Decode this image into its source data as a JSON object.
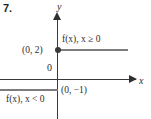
{
  "figure": {
    "problem_number": "7.",
    "axes": {
      "x_label": "x",
      "y_label": "y",
      "origin_label": "0"
    },
    "points": [
      {
        "label": "(0, 2)",
        "x": 0,
        "y": 2,
        "marker": "closed-dot"
      },
      {
        "label": "(0, −1)",
        "x": 0,
        "y": -1,
        "marker": "none"
      }
    ],
    "pieces": [
      {
        "label": "f(x), x ≥ 0",
        "value": 2,
        "domain": "x ≥ 0"
      },
      {
        "label": "f(x), x < 0",
        "value": -1,
        "domain": "x < 0"
      }
    ],
    "colors": {
      "axis": "#3a3a3a",
      "ray": "#7d7d7d",
      "text": "#2b2b2b",
      "background": "#ffffff"
    }
  },
  "chart_data": {
    "type": "line",
    "title": "",
    "subtitle": "",
    "xlabel": "x",
    "ylabel": "y",
    "xlim": [
      -7,
      10
    ],
    "ylim": [
      -4,
      8
    ],
    "grid": false,
    "legend": "none",
    "series": [
      {
        "name": "f(x), x ≥ 0",
        "values": [
          {
            "x": 0,
            "y": 2
          },
          {
            "x": 8,
            "y": 2
          }
        ],
        "style": "ray-right",
        "endpoint": "closed",
        "color": "#7d7d7d"
      },
      {
        "name": "f(x), x < 0",
        "values": [
          {
            "x": -7,
            "y": -1
          },
          {
            "x": 0,
            "y": -1
          }
        ],
        "style": "ray-left",
        "endpoint": "open",
        "color": "#7d7d7d"
      }
    ],
    "annotations": [
      {
        "text": "(0, 2)",
        "x": 0,
        "y": 2
      },
      {
        "text": "(0, −1)",
        "x": 0,
        "y": -1
      },
      {
        "text": "f(x), x ≥ 0",
        "x": 1,
        "y": 3
      },
      {
        "text": "f(x), x < 0",
        "x": -6,
        "y": -2
      },
      {
        "text": "0",
        "x": 0,
        "y": 0
      }
    ]
  }
}
